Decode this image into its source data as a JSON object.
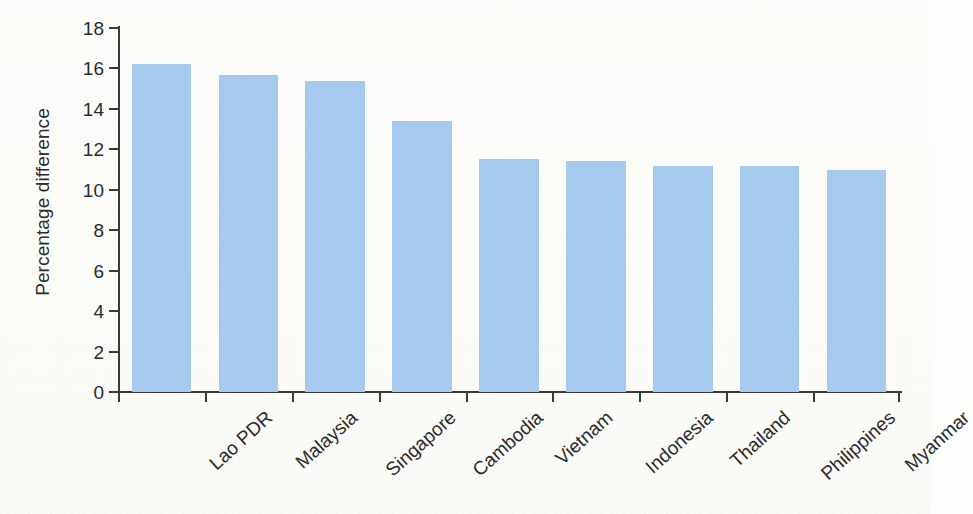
{
  "chart_data": {
    "type": "bar",
    "title": "",
    "subtitle": "",
    "xlabel": "",
    "ylabel": "Percentage difference",
    "categories": [
      "Lao PDR",
      "Malaysia",
      "Singapore",
      "Cambodia",
      "Vietnam",
      "Indonesia",
      "Thailand",
      "Philippines",
      "Myanmar"
    ],
    "values": [
      16.2,
      15.7,
      15.4,
      13.4,
      11.5,
      11.4,
      11.2,
      11.2,
      11.0
    ],
    "ylim": [
      0,
      18
    ],
    "yticks": [
      0,
      2,
      4,
      6,
      8,
      10,
      12,
      14,
      16,
      18
    ],
    "ytick_labels": [
      "0",
      "2",
      "4",
      "6",
      "8",
      "10",
      "12",
      "14",
      "16",
      "18"
    ],
    "grid": false,
    "legend": null,
    "legend_position": "none",
    "bar_color": "#a6caee",
    "axis_color": "#3a3a38",
    "background_color": "#fbfbf8",
    "annotations": []
  }
}
